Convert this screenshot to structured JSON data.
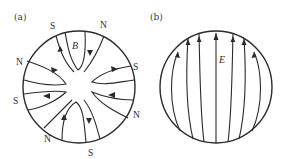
{
  "panels": [
    {
      "id": "a",
      "label": "(a)",
      "field_symbol": "B",
      "description": "Magnetic field lines with alternating N/S poles around circle",
      "poles": [
        {
          "text": "S",
          "position": "top-left"
        },
        {
          "text": "N",
          "position": "top-right"
        },
        {
          "text": "N",
          "position": "upper-left"
        },
        {
          "text": "S",
          "position": "upper-right"
        },
        {
          "text": "S",
          "position": "lower-left"
        },
        {
          "text": "N",
          "position": "lower-right"
        },
        {
          "text": "N",
          "position": "bottom-left"
        },
        {
          "text": "S",
          "position": "bottom-right"
        }
      ]
    },
    {
      "id": "b",
      "label": "(b)",
      "field_symbol": "E",
      "description": "Electric field lines pointing upward, spreading near bottom"
    }
  ],
  "colors": {
    "stroke": "#2b2b2b",
    "background": "#ffffff"
  }
}
